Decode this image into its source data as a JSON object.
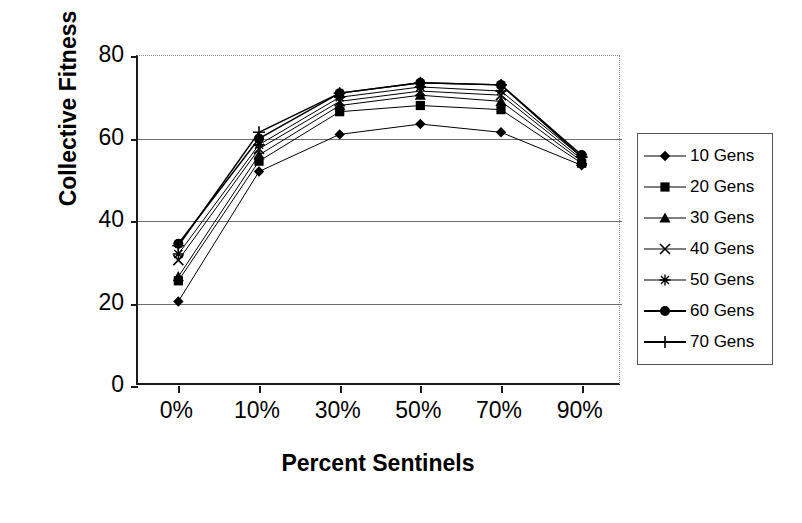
{
  "chart_data": {
    "type": "line",
    "title": "",
    "xlabel": "Percent Sentinels",
    "ylabel": "Collective Fitness",
    "categories": [
      "0%",
      "10%",
      "30%",
      "50%",
      "70%",
      "90%"
    ],
    "ylim": [
      0,
      80
    ],
    "yticks": [
      0,
      20,
      40,
      60,
      80
    ],
    "grid": "horizontal",
    "legend_position": "right",
    "series": [
      {
        "name": "10 Gens",
        "marker": "diamond",
        "values": [
          20.5,
          52.0,
          61.0,
          63.5,
          61.5,
          53.5
        ]
      },
      {
        "name": "20 Gens",
        "marker": "square",
        "values": [
          25.5,
          54.5,
          66.5,
          68.0,
          67.0,
          54.0
        ]
      },
      {
        "name": "30 Gens",
        "marker": "triangle",
        "values": [
          26.5,
          56.0,
          68.0,
          70.5,
          69.0,
          54.5
        ]
      },
      {
        "name": "40 Gens",
        "marker": "x",
        "values": [
          30.5,
          57.5,
          69.0,
          71.5,
          70.5,
          55.0
        ]
      },
      {
        "name": "50 Gens",
        "marker": "asterisk",
        "values": [
          32.0,
          58.5,
          70.0,
          72.5,
          71.5,
          55.5
        ]
      },
      {
        "name": "60 Gens",
        "marker": "circle",
        "values": [
          34.5,
          60.0,
          71.0,
          73.5,
          73.0,
          56.0
        ]
      },
      {
        "name": "70 Gens",
        "marker": "plus",
        "values": [
          34.0,
          61.5,
          71.0,
          73.5,
          73.0,
          55.5
        ]
      }
    ]
  },
  "axes": {
    "ytick_labels": [
      "80",
      "60",
      "40",
      "20",
      "0"
    ],
    "xtick_labels": [
      "0%",
      "10%",
      "30%",
      "50%",
      "70%",
      "90%"
    ]
  },
  "legend": {
    "entries": [
      {
        "label": "10 Gens"
      },
      {
        "label": "20 Gens"
      },
      {
        "label": "30 Gens"
      },
      {
        "label": "40 Gens"
      },
      {
        "label": "50 Gens"
      },
      {
        "label": "60 Gens"
      },
      {
        "label": "70 Gens"
      }
    ]
  },
  "colors": {
    "series": "#000000",
    "grid": "#6d6d6d",
    "axis": "#1a1a1a",
    "background": "#ffffff"
  }
}
